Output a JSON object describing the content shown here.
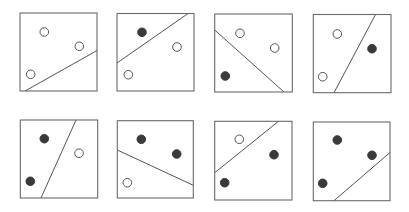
{
  "diagram": {
    "colors": {
      "background": "#ffffff",
      "border": "#6a6a6a",
      "line": "#555555",
      "filled": "#3a3a3a",
      "open_stroke": "#555555",
      "open_fill": "#ffffff"
    },
    "point_radius": 4.3,
    "panels": [
      {
        "id": "p1",
        "box": [
          20,
          13,
          97,
          91
        ],
        "points": [
          {
            "x": 44.3,
            "y": 32,
            "filled": false
          },
          {
            "x": 79.3,
            "y": 46.3,
            "filled": false
          },
          {
            "x": 30.7,
            "y": 74.3,
            "filled": false
          }
        ],
        "line": [
          25,
          91,
          97,
          50.5
        ]
      },
      {
        "id": "p2",
        "box": [
          117,
          13.5,
          194,
          91
        ],
        "points": [
          {
            "x": 142,
            "y": 32.3,
            "filled": true
          },
          {
            "x": 177,
            "y": 47,
            "filled": false
          },
          {
            "x": 128.3,
            "y": 74.7,
            "filled": false
          }
        ],
        "line": [
          117,
          63,
          188,
          13.5
        ]
      },
      {
        "id": "p3",
        "box": [
          214.7,
          14,
          292.3,
          92
        ],
        "points": [
          {
            "x": 240,
            "y": 33.3,
            "filled": false
          },
          {
            "x": 274.7,
            "y": 48,
            "filled": false
          },
          {
            "x": 225.3,
            "y": 76,
            "filled": true
          }
        ],
        "line": [
          214.7,
          30,
          284,
          92
        ]
      },
      {
        "id": "p4",
        "box": [
          313.3,
          14.5,
          391,
          92.7
        ],
        "points": [
          {
            "x": 337.3,
            "y": 34,
            "filled": false
          },
          {
            "x": 372,
            "y": 48.7,
            "filled": true
          },
          {
            "x": 322.7,
            "y": 76.7,
            "filled": false
          }
        ],
        "line": [
          334,
          92.7,
          375.5,
          14.5
        ]
      },
      {
        "id": "p5",
        "box": [
          20.3,
          120,
          97.7,
          198
        ],
        "points": [
          {
            "x": 44.3,
            "y": 138.7,
            "filled": true
          },
          {
            "x": 79,
            "y": 153.3,
            "filled": false
          },
          {
            "x": 30.3,
            "y": 181.3,
            "filled": true
          }
        ],
        "line": [
          41,
          198,
          76,
          120
        ]
      },
      {
        "id": "p6",
        "box": [
          117.3,
          120.7,
          193.3,
          198
        ],
        "points": [
          {
            "x": 141.3,
            "y": 139.3,
            "filled": true
          },
          {
            "x": 176.7,
            "y": 154,
            "filled": true
          },
          {
            "x": 127.3,
            "y": 182.7,
            "filled": false
          }
        ],
        "line": [
          117.3,
          150,
          193.3,
          185.3
        ]
      },
      {
        "id": "p7",
        "box": [
          214.7,
          121.3,
          292,
          200
        ],
        "points": [
          {
            "x": 239.3,
            "y": 139.3,
            "filled": false
          },
          {
            "x": 274,
            "y": 154.7,
            "filled": true
          },
          {
            "x": 224.7,
            "y": 182.7,
            "filled": true
          }
        ],
        "line": [
          214.7,
          172.7,
          278.5,
          121.3
        ]
      },
      {
        "id": "p8",
        "box": [
          313.3,
          122,
          390,
          200.7
        ],
        "points": [
          {
            "x": 337.3,
            "y": 140,
            "filled": true
          },
          {
            "x": 372,
            "y": 155.3,
            "filled": true
          },
          {
            "x": 322.7,
            "y": 183.3,
            "filled": true
          }
        ],
        "line": [
          334,
          200.7,
          390,
          152.5
        ]
      }
    ]
  }
}
